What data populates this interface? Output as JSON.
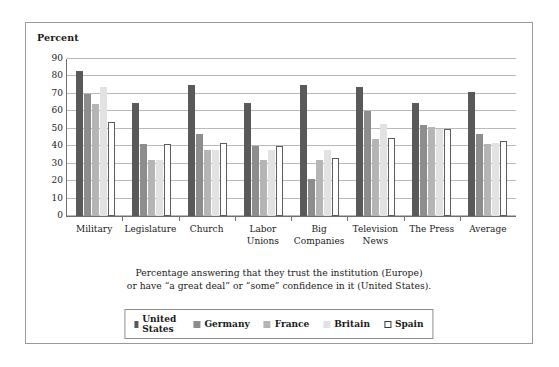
{
  "figure": {
    "axis_title": "Percent",
    "caption_line1": "Percentage answering that they trust the institution (Europe)",
    "caption_line2": "or have “a great deal” or “some” confidence in it (United States)."
  },
  "colors": {
    "united_states": "#595959",
    "germany": "#8d8d8d",
    "france": "#b5b5b5",
    "britain": "#e2e2e2",
    "spain": "#ffffff",
    "spain_border": "#5d5d5d",
    "gridline": "#b9b9b9",
    "axis": "#6f6f6f",
    "frame": "#9a9a9a"
  },
  "chart_data": {
    "type": "bar",
    "title": "",
    "xlabel": "",
    "ylabel": "Percent",
    "ylim": [
      0,
      90
    ],
    "yticks": [
      0,
      10,
      20,
      30,
      40,
      50,
      60,
      70,
      80,
      90
    ],
    "grid": true,
    "legend_position": "bottom",
    "categories": [
      "Military",
      "Legislature",
      "Church",
      "Labor\nUnions",
      "Big\nCompanies",
      "Television\nNews",
      "The Press",
      "Average"
    ],
    "series": [
      {
        "name": "United States",
        "values": [
          83,
          65,
          75,
          65,
          75,
          74,
          65,
          71
        ]
      },
      {
        "name": "Germany",
        "values": [
          70,
          41,
          47,
          40,
          21,
          60,
          52,
          47
        ]
      },
      {
        "name": "France",
        "values": [
          64,
          32,
          38,
          32,
          32,
          44,
          51,
          41
        ]
      },
      {
        "name": "Britain",
        "values": [
          74,
          32,
          38,
          38,
          38,
          53,
          50,
          42
        ]
      },
      {
        "name": "Spain",
        "values": [
          54,
          41,
          42,
          40,
          33,
          45,
          50,
          43
        ]
      }
    ]
  }
}
